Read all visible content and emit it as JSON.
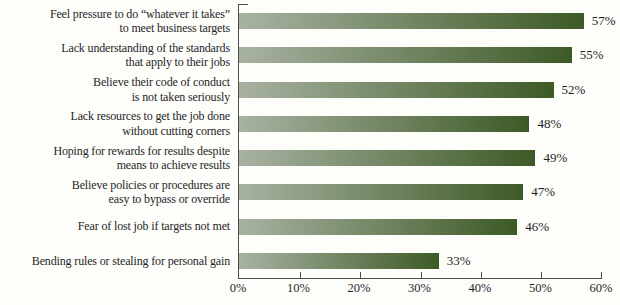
{
  "chart_data": {
    "type": "bar",
    "orientation": "horizontal",
    "title": "",
    "xlabel": "",
    "ylabel": "",
    "grid": false,
    "xlim": [
      0,
      60
    ],
    "xmax": 60,
    "categories": [
      "Feel pressure to do “whatever it takes”\nto meet business targets",
      "Lack understanding of the standards\nthat apply to their jobs",
      "Believe their code of conduct\nis not taken seriously",
      "Lack resources to get the job done\nwithout cutting corners",
      "Hoping for rewards for results despite\nmeans to achieve results",
      "Believe policies or procedures are\neasy to bypass or override",
      "Fear of lost job if targets not met",
      "Bending rules or stealing for personal gain"
    ],
    "values": [
      57,
      55,
      52,
      48,
      49,
      47,
      46,
      33
    ],
    "value_labels": [
      "57%",
      "55%",
      "52%",
      "48%",
      "49%",
      "47%",
      "46%",
      "33%"
    ],
    "tick_labels": [
      "0%",
      "10%",
      "20%",
      "30%",
      "40%",
      "50%",
      "60%"
    ],
    "colors": {
      "bar_gradient_start": "#a9b2a2",
      "bar_gradient_end": "#3d5a26",
      "axis": "#4d4d4d",
      "text": "#1f1f28",
      "background": "#fdfdfa"
    }
  }
}
